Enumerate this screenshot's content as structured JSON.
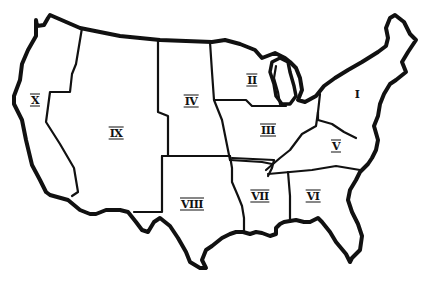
{
  "map": {
    "title": "United States regions map",
    "style": {
      "line_color": "#111111",
      "background": "#ffffff"
    },
    "regions": [
      {
        "id": "I",
        "label": "I",
        "x": 357,
        "y": 94
      },
      {
        "id": "II",
        "label": "II",
        "x": 252,
        "y": 80
      },
      {
        "id": "III",
        "label": "III",
        "x": 268,
        "y": 130
      },
      {
        "id": "IV",
        "label": "IV",
        "x": 191,
        "y": 101
      },
      {
        "id": "V",
        "label": "V",
        "x": 336,
        "y": 146
      },
      {
        "id": "VI",
        "label": "VI",
        "x": 313,
        "y": 196
      },
      {
        "id": "VII",
        "label": "VII",
        "x": 260,
        "y": 196
      },
      {
        "id": "VIII",
        "label": "VIII",
        "x": 192,
        "y": 204
      },
      {
        "id": "IX",
        "label": "IX",
        "x": 116,
        "y": 133
      },
      {
        "id": "X",
        "label": "X",
        "x": 35,
        "y": 100
      }
    ]
  }
}
